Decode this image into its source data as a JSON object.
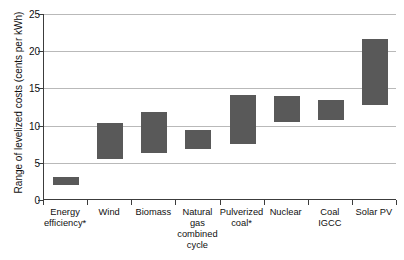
{
  "chart_data": {
    "type": "bar",
    "subtype": "floating-range-bar",
    "title": "",
    "xlabel": "",
    "ylabel": "Range of levelized costs (cents per kWh)",
    "ylim": [
      0,
      25
    ],
    "yticks": [
      0,
      5,
      10,
      15,
      20,
      25
    ],
    "ytick_labels": [
      "0",
      "5",
      "10",
      "15",
      "20",
      "25"
    ],
    "grid": true,
    "legend": false,
    "bar_color": "#595959",
    "gridline_color": "#b9b9b9",
    "axis_color": "#3c3c3c",
    "categories": [
      "Energy efficiency*",
      "Wind",
      "Biomass",
      "Natural gas combined cycle",
      "Pulverized coal*",
      "Nuclear",
      "Coal IGCC",
      "Solar PV"
    ],
    "category_lines": [
      [
        "Energy",
        "efficiency*"
      ],
      [
        "Wind"
      ],
      [
        "Biomass"
      ],
      [
        "Natural gas",
        "combined",
        "cycle"
      ],
      [
        "Pulverized",
        "coal*"
      ],
      [
        "Nuclear"
      ],
      [
        "Coal IGCC"
      ],
      [
        "Solar PV"
      ]
    ],
    "low": [
      2.0,
      5.5,
      6.3,
      6.8,
      7.5,
      10.5,
      10.8,
      12.7
    ],
    "high": [
      3.1,
      10.4,
      11.8,
      9.4,
      14.1,
      14.0,
      13.4,
      21.6
    ],
    "series": [
      {
        "name": "Range of levelized costs",
        "points": [
          {
            "category": "Energy efficiency*",
            "low": 2.0,
            "high": 3.1
          },
          {
            "category": "Wind",
            "low": 5.5,
            "high": 10.4
          },
          {
            "category": "Biomass",
            "low": 6.3,
            "high": 11.8
          },
          {
            "category": "Natural gas combined cycle",
            "low": 6.8,
            "high": 9.4
          },
          {
            "category": "Pulverized coal*",
            "low": 7.5,
            "high": 14.1
          },
          {
            "category": "Nuclear",
            "low": 10.5,
            "high": 14.0
          },
          {
            "category": "Coal IGCC",
            "low": 10.8,
            "high": 13.4
          },
          {
            "category": "Solar PV",
            "low": 12.7,
            "high": 21.6
          }
        ]
      }
    ]
  }
}
